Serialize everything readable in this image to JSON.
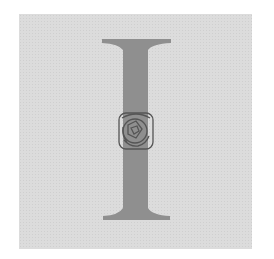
{
  "illustration": {
    "type": "decorative drop cap",
    "letter": "I",
    "ornament": "rose-emblem",
    "colors": {
      "background": "#ffffff",
      "panel": "#dcdcdc",
      "letter": "#8f8f8f",
      "ornament_stroke": "#555555"
    }
  }
}
